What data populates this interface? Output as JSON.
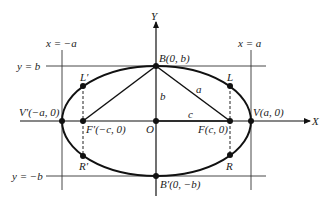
{
  "diagram": {
    "type": "ellipse-with-foci",
    "axes": {
      "x_label": "X",
      "y_label": "Y"
    },
    "lines": {
      "x_neg_a": "x = −a",
      "x_pos_a": "x = a",
      "y_pos_b": "y = b",
      "y_neg_b": "y = −b"
    },
    "points": {
      "B": "B(0, b)",
      "B_prime": "B′(0, −b)",
      "V": "V(a, 0)",
      "V_prime": "V′(−a, 0)",
      "F": "F(c, 0)",
      "F_prime": "F′(−c, 0)",
      "O": "O",
      "L": "L",
      "L_prime": "L′",
      "R": "R",
      "R_prime": "R′"
    },
    "segments": {
      "a": "a",
      "b": "b",
      "c": "c"
    }
  }
}
